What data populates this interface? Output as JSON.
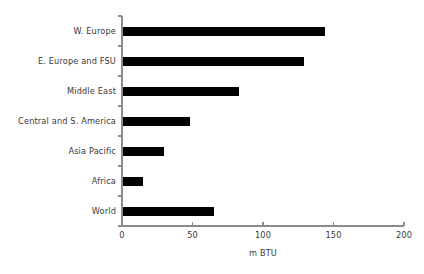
{
  "chart_data": {
    "type": "bar",
    "orientation": "horizontal",
    "title": "",
    "subtitle": "",
    "xlabel": "m BTU",
    "ylabel": "",
    "categories": [
      "W. Europe",
      "E. Europe and FSU",
      "Middle East",
      "Central and S. America",
      "Asia Pacific",
      "Africa",
      "World"
    ],
    "values": [
      144,
      129,
      83,
      48,
      30,
      15,
      65
    ],
    "xlim": [
      0,
      200
    ],
    "xticks": [
      0,
      50,
      100,
      150,
      200
    ],
    "xtick_labels": [
      "0",
      "50",
      "100",
      "150",
      "200"
    ],
    "grid": false,
    "legend": null,
    "bar_color": "#000000",
    "axis_color": "#8c8c8c",
    "text_color": "#3a3a3a",
    "background_color": "#ffffff"
  },
  "geometry": {
    "plot_left": 122,
    "plot_right": 404,
    "plot_top": 16,
    "plot_bottom": 226,
    "bar_thickness": 9,
    "label_right_edge": 116
  }
}
